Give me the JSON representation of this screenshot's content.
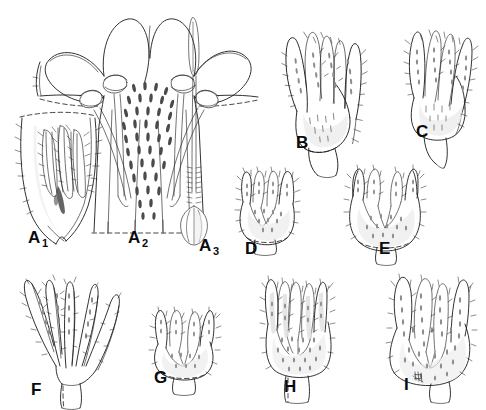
{
  "plate": {
    "title": "Botanical line illustration plate",
    "subject": "Flower dissection and calyx comparison",
    "background_color": "#ffffff",
    "ink_color": "#1b1b1b",
    "label_color": "#0b0b0b",
    "width": 486,
    "height": 410
  },
  "figures": [
    {
      "id": "A1",
      "label": "A",
      "sublabel": "1",
      "label_x": 28,
      "label_y": 243,
      "caption": "Corolla opened out showing didynamous stamens within tube",
      "row": "top"
    },
    {
      "id": "A2",
      "label": "A",
      "sublabel": "2",
      "label_x": 128,
      "label_y": 243,
      "caption": "Corolla face view with four exserted stamens and spotted throat",
      "row": "top"
    },
    {
      "id": "A3",
      "label": "A",
      "sublabel": "3",
      "label_x": 199,
      "label_y": 251,
      "caption": "Pistil with ovary, long style and linear stigma",
      "row": "top"
    },
    {
      "id": "B",
      "label": "B",
      "sublabel": "",
      "label_x": 296,
      "label_y": 148,
      "caption": "Calyx, lateral view, lobes narrowly lanceolate and hispid",
      "row": "top"
    },
    {
      "id": "C",
      "label": "C",
      "sublabel": "",
      "label_x": 416,
      "label_y": 137,
      "caption": "Calyx with spreading setose lobes on short pedicel",
      "row": "top"
    },
    {
      "id": "D",
      "label": "D",
      "sublabel": "",
      "label_x": 245,
      "label_y": 254,
      "caption": "Calyx, small, lobes short and hispid",
      "row": "middle"
    },
    {
      "id": "E",
      "label": "E",
      "sublabel": "",
      "label_x": 379,
      "label_y": 254,
      "caption": "Calyx, broadly obovoid with shallow acute lobes",
      "row": "middle"
    },
    {
      "id": "F",
      "label": "F",
      "sublabel": "",
      "label_x": 31,
      "label_y": 395,
      "caption": "Calyx deeply divided, lobes linear and spreading",
      "row": "bottom"
    },
    {
      "id": "G",
      "label": "G",
      "sublabel": "",
      "label_x": 154,
      "label_y": 383,
      "caption": "Calyx small, lobes narrow and setose",
      "row": "bottom"
    },
    {
      "id": "H",
      "label": "H",
      "sublabel": "",
      "label_x": 284,
      "label_y": 392,
      "caption": "Calyx tubular-campanulate with erect hispid lobes",
      "row": "bottom"
    },
    {
      "id": "I",
      "label": "I",
      "sublabel": "",
      "label_x": 404,
      "label_y": 390,
      "caption": "Calyx broadly obovate, densely punctate and hispid",
      "row": "bottom"
    }
  ]
}
